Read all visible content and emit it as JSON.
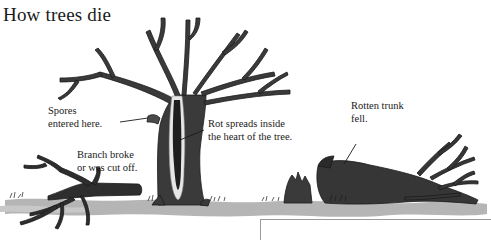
{
  "title": "How trees die",
  "labels": {
    "spores": [
      "Spores",
      "entered here."
    ],
    "branch": [
      "Branch broke",
      "or was cut off."
    ],
    "rot": [
      "Rot spreads inside",
      "the heart of the tree."
    ],
    "trunk": [
      "Rotten trunk",
      "fell."
    ]
  },
  "colors": {
    "bark": "#3a3a3a",
    "bark_dark": "#1e1e1e",
    "ground": "#b5b5b5",
    "rot_highlight": "#e6e6e6",
    "text": "#1a1a1a"
  },
  "illustration": {
    "elements": [
      "fallen-branch",
      "dead-standing-tree",
      "tree-stump",
      "fallen-rotten-trunk",
      "ground-shadow"
    ]
  }
}
